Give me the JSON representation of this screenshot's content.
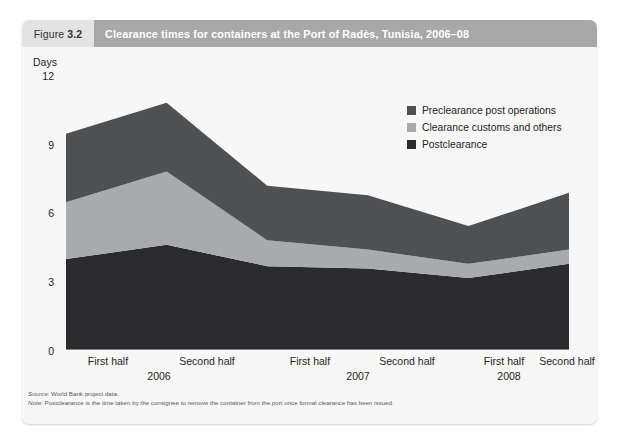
{
  "figure": {
    "number_word": "Figure",
    "number": "3.2",
    "title": "Clearance times for containers at the Port of Radès, Tunisia, 2006–08"
  },
  "footnotes": {
    "source_key": "Source:",
    "source_text": " World Bank project data.",
    "note_key": "Note:",
    "note_text": " Postclearance is the time taken by the consignee to remove the container from the port once formal clearance has been issued."
  },
  "colors": {
    "preclearance": "#4f5052",
    "clearance_customs": "#a9aaac",
    "postclearance": "#2b2b2d",
    "header_bar": "#a8a8a8",
    "header_number_bg": "#e3e3e3",
    "card_bg": "#f7f7f7",
    "plot_bg": "#f7f7f7",
    "text": "#231f20"
  },
  "chart_data": {
    "type": "area",
    "title": "Clearance times for containers at the Port of Radès, Tunisia, 2006–08",
    "xlabel": "",
    "ylabel": "Days",
    "ylim": [
      0,
      12
    ],
    "yticks": [
      0,
      3,
      6,
      9,
      12
    ],
    "ytick_labels": [
      "0",
      "3",
      "6",
      "9",
      "12"
    ],
    "grid": false,
    "stacked": true,
    "legend_position": "top-right",
    "categories": [
      "First half",
      "Second half",
      "First half",
      "Second half",
      "First half",
      "Second half"
    ],
    "group_labels": [
      "2006",
      "2007",
      "2008"
    ],
    "series": [
      {
        "name": "Preclearance post operations",
        "color": "#4f5052",
        "values": [
          2.9,
          2.9,
          2.3,
          2.3,
          1.6,
          2.4
        ]
      },
      {
        "name": "Clearance customs and others",
        "color": "#a9aaac",
        "values": [
          2.4,
          3.1,
          1.1,
          0.8,
          0.6,
          0.6
        ]
      },
      {
        "name": "Postclearance",
        "color": "#2b2b2d",
        "values": [
          3.8,
          4.4,
          3.5,
          3.4,
          3.0,
          3.6
        ]
      }
    ],
    "stack_order_bottom_to_top": [
      "Postclearance",
      "Clearance customs and others",
      "Preclearance post operations"
    ],
    "totals": [
      9.1,
      10.4,
      6.9,
      6.5,
      5.2,
      6.6
    ],
    "units": "Days"
  },
  "legend": [
    {
      "label": "Preclearance post operations",
      "color": "#4f5052"
    },
    {
      "label": "Clearance customs and others",
      "color": "#a9aaac"
    },
    {
      "label": "Postclearance",
      "color": "#2b2b2d"
    }
  ],
  "y_axis": {
    "title": "Days",
    "ticks": [
      "12",
      "9",
      "6",
      "3",
      "0"
    ]
  },
  "x_axis": {
    "halves": [
      "First half",
      "Second half",
      "First half",
      "Second half",
      "First half",
      "Second half"
    ],
    "years": [
      "2006",
      "2007",
      "2008"
    ]
  }
}
